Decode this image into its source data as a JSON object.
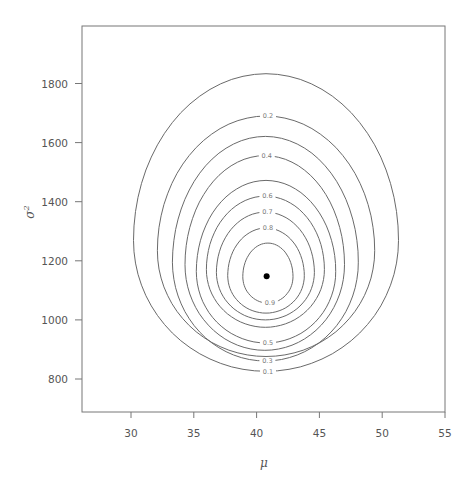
{
  "chart_data": {
    "type": "contour",
    "title": "",
    "xlabel": "μ",
    "ylabel": "σ²",
    "xlim": [
      26.1,
      55
    ],
    "ylim": [
      689,
      1993
    ],
    "xticks": [
      30,
      35,
      40,
      45,
      50,
      55
    ],
    "yticks": [
      800,
      1000,
      1200,
      1400,
      1600,
      1800
    ],
    "grid": false,
    "legend": null,
    "mode_point": {
      "mu": 40.8,
      "sigma2": 1148,
      "marker": "filled-circle",
      "color": "#000000"
    },
    "contour_levels": [
      0.1,
      0.2,
      0.3,
      0.4,
      0.5,
      0.6,
      0.7,
      0.8,
      0.9
    ],
    "contours": [
      {
        "level": 0.1,
        "label": "0.1",
        "label_pos": "bottom",
        "mu_min": 30.2,
        "mu_max": 51.3,
        "sigma2_min": 826,
        "sigma2_max": 1833
      },
      {
        "level": 0.2,
        "label": "0.2",
        "label_pos": "top",
        "mu_min": 32.1,
        "mu_max": 49.4,
        "sigma2_min": 876,
        "sigma2_max": 1690
      },
      {
        "level": 0.3,
        "label": "0.3",
        "label_pos": "bottom",
        "mu_min": 33.3,
        "mu_max": 48.1,
        "sigma2_min": 861,
        "sigma2_max": 1621
      },
      {
        "level": 0.4,
        "label": "0.4",
        "label_pos": "top",
        "mu_min": 34.3,
        "mu_max": 47.0,
        "sigma2_min": 897,
        "sigma2_max": 1556
      },
      {
        "level": 0.5,
        "label": "0.5",
        "label_pos": "bottom",
        "mu_min": 35.2,
        "mu_max": 46.3,
        "sigma2_min": 922,
        "sigma2_max": 1472
      },
      {
        "level": 0.6,
        "label": "0.6",
        "label_pos": "top",
        "mu_min": 36.0,
        "mu_max": 45.4,
        "sigma2_min": 975,
        "sigma2_max": 1419
      },
      {
        "level": 0.7,
        "label": "0.7",
        "label_pos": "top",
        "mu_min": 36.8,
        "mu_max": 44.6,
        "sigma2_min": 1000,
        "sigma2_max": 1365
      },
      {
        "level": 0.8,
        "label": "0.8",
        "label_pos": "top",
        "mu_min": 37.7,
        "mu_max": 43.8,
        "sigma2_min": 1023,
        "sigma2_max": 1311
      },
      {
        "level": 0.9,
        "label": "0.9",
        "label_pos": "bottom",
        "mu_min": 38.9,
        "mu_max": 42.9,
        "sigma2_min": 1057,
        "sigma2_max": 1260
      }
    ]
  },
  "layout": {
    "frame": {
      "left": 82,
      "top": 26,
      "right": 445,
      "bottom": 412
    },
    "x_px_per_unit": 12.56,
    "x_ref": {
      "value": 30,
      "px": 131
    },
    "y_px_per_unit": 0.2955,
    "y_ref": {
      "value": 800,
      "px": 379
    }
  }
}
